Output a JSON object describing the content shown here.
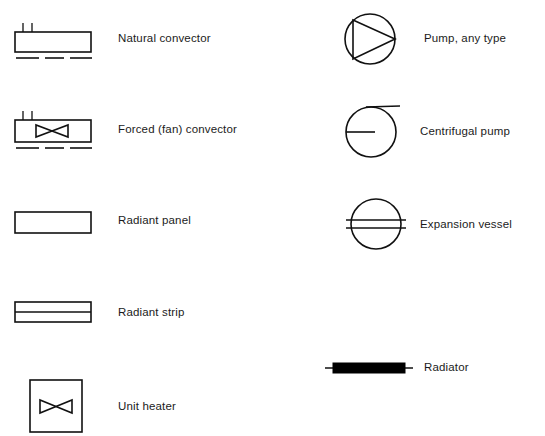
{
  "diagram": {
    "background_color": "#ffffff",
    "line_color": "#111111",
    "columns": [
      {
        "name": "left-column",
        "entries": [
          {
            "id": "natural-convector",
            "icon": "natural-convector-icon",
            "label": "Natural convector",
            "symbol_x": 14,
            "symbol_y": 22,
            "label_x": 118,
            "label_y": 38,
            "body_width": 76,
            "body_height": 20,
            "stub_count": 2,
            "dash_count": 3,
            "has_fan": false
          },
          {
            "id": "forced-fan-convector",
            "icon": "forced-convector-icon",
            "label": "Forced (fan) convector",
            "symbol_x": 14,
            "symbol_y": 110,
            "label_x": 118,
            "label_y": 129,
            "body_width": 76,
            "body_height": 22,
            "stub_count": 2,
            "dash_count": 3,
            "has_fan": true
          },
          {
            "id": "radiant-panel",
            "icon": "radiant-panel-icon",
            "label": "Radiant panel",
            "symbol_x": 14,
            "symbol_y": 211,
            "label_x": 118,
            "label_y": 222,
            "body_width": 76,
            "body_height": 21,
            "stub_count": 0,
            "dash_count": 0,
            "has_fan": false
          },
          {
            "id": "radiant-strip",
            "icon": "radiant-strip-icon",
            "label": "Radiant strip",
            "symbol_x": 14,
            "symbol_y": 301,
            "label_x": 118,
            "label_y": 314,
            "body_width": 76,
            "body_height": 20,
            "divider_count": 1,
            "has_fan": false
          },
          {
            "id": "unit-heater",
            "icon": "unit-heater-icon",
            "label": "Unit heater",
            "symbol_x": 29,
            "symbol_y": 379,
            "label_x": 118,
            "label_y": 407,
            "body_width": 52,
            "body_height": 52,
            "has_fan": true
          }
        ]
      },
      {
        "name": "right-column",
        "entries": [
          {
            "id": "pump-any-type",
            "icon": "pump-icon",
            "label": "Pump, any type",
            "symbol_x": 343,
            "symbol_y": 12,
            "label_x": 424,
            "label_y": 38,
            "radius": 25,
            "shape": "circle-with-triangle"
          },
          {
            "id": "centrifugal-pump",
            "icon": "centrifugal-pump-icon",
            "label": "Centrifugal pump",
            "symbol_x": 344,
            "symbol_y": 104,
            "label_x": 420,
            "label_y": 131,
            "radius": 25,
            "shape": "circle-with-inlet-outlet"
          },
          {
            "id": "expansion-vessel",
            "icon": "expansion-vessel-icon",
            "label": "Expansion vessel",
            "symbol_x": 344,
            "symbol_y": 196,
            "label_x": 420,
            "label_y": 224,
            "radius": 25,
            "shape": "circle-with-two-lines"
          },
          {
            "id": "radiator",
            "icon": "radiator-icon",
            "label": "Radiator",
            "symbol_x": 325,
            "symbol_y": 360,
            "label_x": 424,
            "label_y": 369,
            "bar_width": 78,
            "bar_height": 9,
            "shape": "filled-bar"
          }
        ]
      }
    ]
  }
}
